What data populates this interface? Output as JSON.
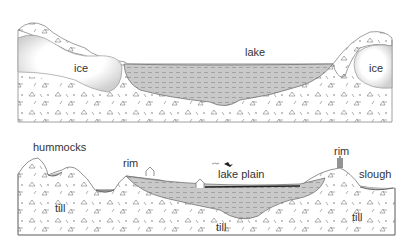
{
  "top_panel": {
    "labels": {
      "lake": "lake",
      "ice_left": "ice",
      "ice_right": "ice"
    }
  },
  "bottom_panel": {
    "labels": {
      "hummocks": "hummocks",
      "rim_left": "rim",
      "lake_plain": "lake plain",
      "rim_right": "rim",
      "slough": "slough",
      "till_left": "till",
      "till_center": "till",
      "till_right": "till"
    }
  },
  "colors": {
    "outline": "#777777",
    "sediment_fill": "#c9c9c9",
    "ice_shade": "#d6d6d6",
    "text": "#333333"
  }
}
